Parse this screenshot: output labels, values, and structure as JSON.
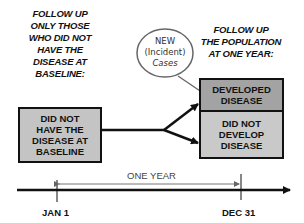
{
  "diagram": {
    "left_caption": [
      "FOLLOW UP",
      "ONLY THOSE",
      "WHO DID NOT",
      "HAVE THE",
      "DISEASE AT",
      "BASELINE:"
    ],
    "right_caption": [
      "FOLLOW UP",
      "THE POPULATION",
      "AT ONE YEAR:"
    ],
    "baseline_box": [
      "DID NOT",
      "HAVE THE",
      "DISEASE AT",
      "BASELINE"
    ],
    "developed_box": [
      "DEVELOPED",
      "DISEASE"
    ],
    "not_developed_box": [
      "DID NOT",
      "DEVELOP",
      "DISEASE"
    ],
    "oval_label": [
      "NEW",
      "(Incident)",
      "Cases"
    ],
    "timeline": {
      "span_label": "ONE YEAR",
      "start_label": "JAN 1",
      "end_label": "DEC 31"
    },
    "colors": {
      "developed_fill": "#a3a3a3",
      "not_developed_fill": "#c9c9c9",
      "baseline_fill": "#c4c4c4",
      "line": "#111111",
      "oval_stroke": "#555555"
    }
  }
}
